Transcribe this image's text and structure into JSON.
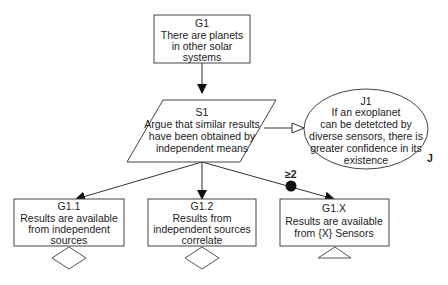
{
  "diagram": {
    "type": "GSN goal structure",
    "nodes": {
      "g1": {
        "id": "G1",
        "type": "goal",
        "lines": [
          "There are planets",
          "in other solar",
          "systems"
        ]
      },
      "s1": {
        "id": "S1",
        "type": "strategy",
        "lines": [
          "Argue that similar results",
          "have been obtained by",
          "independent means"
        ]
      },
      "j1": {
        "id": "J1",
        "type": "justification",
        "marker": "J",
        "lines": [
          "If an exoplanet",
          "can be detetcted by",
          "diverse sensors, there is",
          "greater confidence in its",
          "existence"
        ]
      },
      "g11": {
        "id": "G1.1",
        "type": "goal",
        "decoration": "undeveloped-diamond",
        "lines": [
          "Results are available",
          "from independent",
          "sources"
        ]
      },
      "g12": {
        "id": "G1.2",
        "type": "goal",
        "decoration": "undeveloped-diamond",
        "lines": [
          "Results from",
          "independent sources",
          "correlate"
        ]
      },
      "g1x": {
        "id": "G1.X",
        "type": "goal",
        "decoration": "uninstantiated-triangle",
        "lines": [
          "Results are available",
          "from {X} Sensors"
        ]
      }
    },
    "edges": [
      {
        "from": "G1",
        "to": "S1",
        "kind": "supported-by"
      },
      {
        "from": "S1",
        "to": "J1",
        "kind": "in-context-of"
      },
      {
        "from": "S1",
        "to": "G1.1",
        "kind": "supported-by"
      },
      {
        "from": "S1",
        "to": "G1.2",
        "kind": "supported-by"
      },
      {
        "from": "S1",
        "to": "G1.X",
        "kind": "supported-by",
        "multiplicity": "≥2"
      }
    ],
    "multiplicity_label": "≥2",
    "colors": {
      "stroke": "#333333",
      "fill": "#ffffff",
      "text": "#222222"
    }
  }
}
